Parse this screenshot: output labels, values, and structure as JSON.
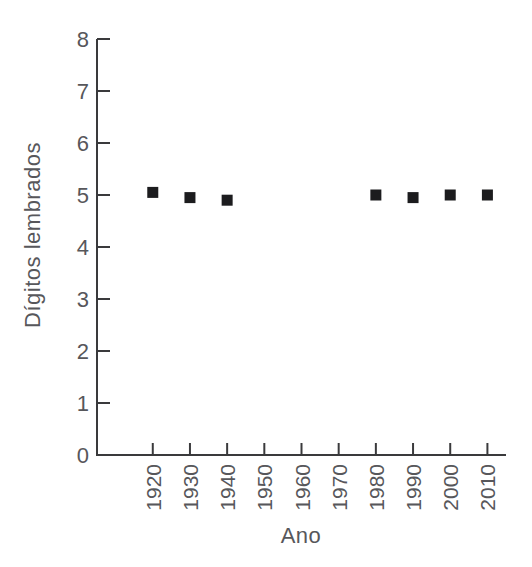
{
  "chart_data": {
    "type": "scatter",
    "title": "",
    "xlabel": "Ano",
    "ylabel": "Dígitos lembrados",
    "x": [
      1920,
      1930,
      1940,
      1980,
      1990,
      2000,
      2010
    ],
    "y": [
      5.05,
      4.95,
      4.9,
      5.0,
      4.95,
      5.0,
      5.0
    ],
    "series_name": "Dígitos lembrados por ano",
    "xlim": [
      1905,
      2015
    ],
    "ylim": [
      0,
      8
    ],
    "x_ticks": [
      1920,
      1930,
      1940,
      1950,
      1960,
      1970,
      1980,
      1990,
      2000,
      2010
    ],
    "y_ticks": [
      0,
      1,
      2,
      3,
      4,
      5,
      6,
      7,
      8
    ],
    "x_tick_label_rotation": -90,
    "grid": false,
    "legend": null,
    "marker": "square",
    "marker_size": 11,
    "marker_color": "#1c1c1e",
    "axis_color": "#3a3a3c",
    "label_color": "#57575b"
  }
}
